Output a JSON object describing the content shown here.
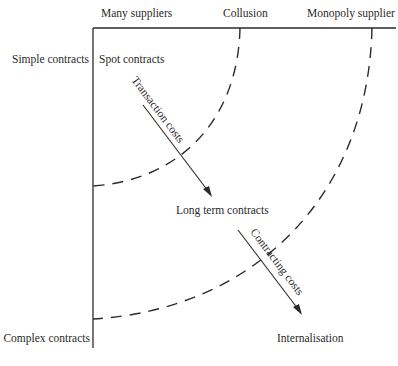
{
  "top_axis": {
    "labels": [
      "Many suppliers",
      "Collusion",
      "Monopoly supplier"
    ]
  },
  "left_axis": {
    "labels": [
      "Simple contracts",
      "Complex contracts"
    ]
  },
  "regions": {
    "spot": "Spot contracts",
    "long_term": "Long term contracts",
    "internal": "Internalisation"
  },
  "arrows": {
    "transaction": "Transaction costs",
    "contracting": "Contracting costs"
  },
  "colors": {
    "ink": "#2a2a2a",
    "background": "#ffffff"
  }
}
